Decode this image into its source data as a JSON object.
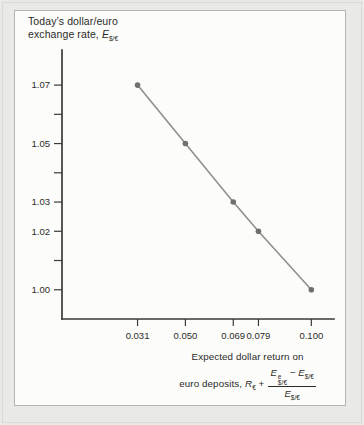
{
  "page": {
    "background": "#e9e9e7",
    "card_background": "#fcfcfa",
    "card_border": "#b3b3b1",
    "outer_frame_border": "#d9d9d7"
  },
  "y_axis_title": {
    "line1": "Today’s dollar/euro",
    "line2_prefix": "exchange rate, ",
    "symbol": "E",
    "symbol_sub": "$/€"
  },
  "x_axis_title": {
    "line1": "Expected dollar return on",
    "line2_prefix": "euro deposits, ",
    "R": "R",
    "R_sub": "€",
    "plus": "+",
    "frac": {
      "num_E1": "E",
      "num_E1_sup": "e",
      "num_E1_sub": "$/€",
      "minus": "−",
      "num_E2": "E",
      "num_E2_sub": "$/€",
      "den_E": "E",
      "den_E_sub": "$/€"
    }
  },
  "chart_data": {
    "type": "line",
    "title": "",
    "xlabel": "Expected dollar return on euro deposits, R€ + (E e $/€ − E$/€) / E$/€",
    "ylabel": "Today’s dollar/euro exchange rate, E$/€",
    "grid": false,
    "legend": false,
    "xlim": [
      0.001,
      0.109
    ],
    "ylim": [
      0.99,
      1.082
    ],
    "series": [
      {
        "name": "expected-dollar-return-schedule",
        "points": [
          [
            0.031,
            1.07
          ],
          [
            0.05,
            1.05
          ],
          [
            0.069,
            1.03
          ],
          [
            0.079,
            1.02
          ],
          [
            0.1,
            1.0
          ]
        ]
      }
    ],
    "x_ticks": [
      {
        "v": 0.031,
        "label": "0.031"
      },
      {
        "v": 0.05,
        "label": "0.050"
      },
      {
        "v": 0.069,
        "label": "0.069"
      },
      {
        "v": 0.079,
        "label": "0.079"
      },
      {
        "v": 0.1,
        "label": "0.100"
      }
    ],
    "y_ticks": [
      {
        "v": 1.0,
        "label": "1.00"
      },
      {
        "v": 1.01,
        "label": ""
      },
      {
        "v": 1.02,
        "label": "1.02"
      },
      {
        "v": 1.03,
        "label": "1.03"
      },
      {
        "v": 1.04,
        "label": ""
      },
      {
        "v": 1.05,
        "label": "1.05"
      },
      {
        "v": 1.06,
        "label": ""
      },
      {
        "v": 1.07,
        "label": "1.07"
      }
    ],
    "colors": {
      "line": "#8f8f8d",
      "point": "#6f6f6d",
      "axis": "#3a3a38",
      "tick_text": "#2b2b29"
    }
  }
}
